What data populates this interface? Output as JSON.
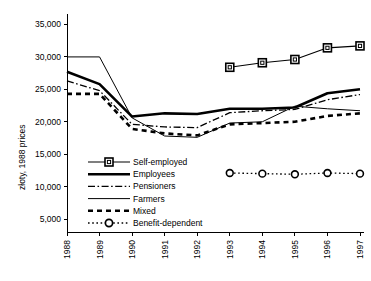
{
  "chart_data": {
    "type": "line",
    "title": "",
    "xlabel": "",
    "ylabel": "złoty, 1988 prices",
    "x": [
      1988,
      1989,
      1990,
      1991,
      1992,
      1993,
      1994,
      1995,
      1996,
      1997
    ],
    "xtick_labels": [
      "1988",
      "1989",
      "1990",
      "1991",
      "1992",
      "1993",
      "1994",
      "1995",
      "1996",
      "1997"
    ],
    "ytick_labels": [
      "5,000",
      "10,000",
      "15,000",
      "20,000",
      "25,000",
      "30,000",
      "35,000"
    ],
    "ytick_values": [
      5000,
      10000,
      15000,
      20000,
      25000,
      30000,
      35000
    ],
    "ylim": [
      3000,
      36000
    ],
    "xlim": [
      1988,
      1997
    ],
    "grid": false,
    "legend_position": "inside-lower-left",
    "series": [
      {
        "name": "Self-employed",
        "style": "solid-thin-square-marker",
        "marker": "square",
        "x": [
          1993,
          1994,
          1995,
          1996,
          1997
        ],
        "values": [
          28400,
          29100,
          29600,
          31400,
          31700
        ]
      },
      {
        "name": "Employees",
        "style": "solid-thick",
        "marker": "none",
        "x": [
          1988,
          1989,
          1990,
          1991,
          1992,
          1993,
          1994,
          1995,
          1996,
          1997
        ],
        "values": [
          27700,
          25800,
          20800,
          21300,
          21200,
          22000,
          22000,
          22200,
          24400,
          25000
        ]
      },
      {
        "name": "Pensioners",
        "style": "dash-dot",
        "marker": "none",
        "x": [
          1988,
          1989,
          1990,
          1991,
          1992,
          1993,
          1994,
          1995,
          1996,
          1997
        ],
        "values": [
          26300,
          24800,
          19600,
          19200,
          19100,
          21400,
          21700,
          21900,
          23400,
          24200
        ]
      },
      {
        "name": "Farmers",
        "style": "solid-thin",
        "marker": "none",
        "x": [
          1988,
          1989,
          1990,
          1991,
          1992,
          1993,
          1994,
          1995,
          1996,
          1997
        ],
        "values": [
          30000,
          30000,
          20600,
          17800,
          17600,
          19800,
          20000,
          22400,
          22000,
          21700
        ]
      },
      {
        "name": "Mixed",
        "style": "dashed-thick",
        "marker": "none",
        "x": [
          1988,
          1989,
          1990,
          1991,
          1992,
          1993,
          1994,
          1995,
          1996,
          1997
        ],
        "values": [
          24300,
          24300,
          18900,
          18200,
          17900,
          19600,
          19800,
          20000,
          20900,
          21300
        ]
      },
      {
        "name": "Benefit-dependent",
        "style": "dotted-circle-marker",
        "marker": "circle",
        "x": [
          1993,
          1994,
          1995,
          1996,
          1997
        ],
        "values": [
          12100,
          12000,
          11900,
          12100,
          12000
        ]
      }
    ]
  },
  "legend": {
    "items": [
      {
        "label": "Self-employed"
      },
      {
        "label": "Employees"
      },
      {
        "label": "Pensioners"
      },
      {
        "label": "Farmers"
      },
      {
        "label": "Mixed"
      },
      {
        "label": "Benefit-dependent"
      }
    ]
  }
}
